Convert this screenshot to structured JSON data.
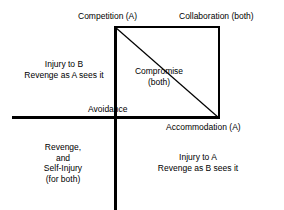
{
  "diagram": {
    "type": "conflict-styles-quadrant",
    "background_color": "#ffffff",
    "stroke_color": "#000000",
    "labels": {
      "competition": "Competition (A)",
      "collaboration": "Collaboration (both)",
      "injury_to_b_line1": "Injury to B",
      "injury_to_b_line2": "Revenge as A sees it",
      "compromise_line1": "Compromise",
      "compromise_line2": "(both)",
      "avoidance": "Avoidance",
      "accommodation": "Accommodation (A)",
      "revenge_self_line1": "Revenge,",
      "revenge_self_line2": "and",
      "revenge_self_line3": "Self-Injury",
      "revenge_self_line4": "(for both)",
      "injury_to_a_line1": "Injury to A",
      "injury_to_a_line2": "Revenge as B sees it"
    }
  }
}
